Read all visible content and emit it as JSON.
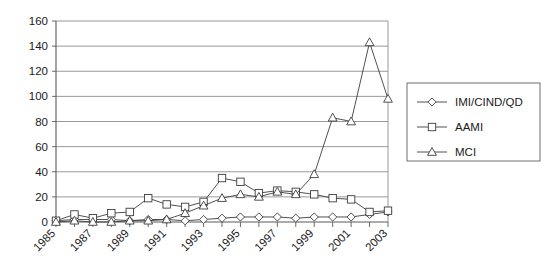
{
  "chart_data": {
    "type": "line",
    "title": "",
    "subtitle": "",
    "xlabel": "",
    "ylabel": "",
    "x": [
      1985,
      1986,
      1987,
      1988,
      1989,
      1990,
      1991,
      1992,
      1993,
      1994,
      1995,
      1996,
      1997,
      1998,
      1999,
      2000,
      2001,
      2002,
      2003
    ],
    "xlim": [
      1985,
      2003
    ],
    "ylim": [
      0,
      160
    ],
    "yticks": [
      0,
      20,
      40,
      60,
      80,
      100,
      120,
      140,
      160
    ],
    "xtick_labels": [
      "1985",
      "1987",
      "1989",
      "1991",
      "1993",
      "1995",
      "1997",
      "1999",
      "2001",
      "2003"
    ],
    "xtick_label_years": [
      1985,
      1987,
      1989,
      1991,
      1993,
      1995,
      1997,
      1999,
      2001,
      2003
    ],
    "xtick_label_rotation": 45,
    "grid": "horizontal",
    "legend_position": "right",
    "series": [
      {
        "name": "IMI/CIND/QD",
        "marker": "diamond",
        "values": [
          1,
          2,
          2,
          2,
          1,
          2,
          2,
          1,
          2,
          3,
          4,
          4,
          4,
          3,
          4,
          4,
          4,
          6,
          8
        ]
      },
      {
        "name": "AAMI",
        "marker": "square",
        "values": [
          1,
          6,
          3,
          7,
          8,
          19,
          14,
          12,
          16,
          35,
          32,
          23,
          25,
          24,
          22,
          19,
          18,
          8,
          9
        ]
      },
      {
        "name": "MCI",
        "marker": "triangle",
        "values": [
          0,
          1,
          0,
          0,
          1,
          1,
          2,
          7,
          13,
          19,
          22,
          20,
          24,
          22,
          38,
          83,
          80,
          143,
          98
        ]
      }
    ]
  },
  "legend": {
    "entries": [
      {
        "label": "IMI/CIND/QD",
        "marker": "diamond"
      },
      {
        "label": "AAMI",
        "marker": "square"
      },
      {
        "label": "MCI",
        "marker": "triangle"
      }
    ]
  },
  "axes": {
    "y_tick_labels": [
      "0",
      "20",
      "40",
      "60",
      "80",
      "100",
      "120",
      "140",
      "160"
    ],
    "x_tick_labels": [
      "1985",
      "1987",
      "1989",
      "1991",
      "1993",
      "1995",
      "1997",
      "1999",
      "2001",
      "2003"
    ]
  }
}
